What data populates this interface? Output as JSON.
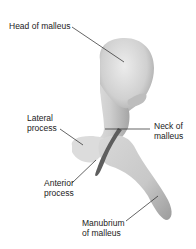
{
  "figure": {
    "labels": [
      {
        "id": "head",
        "text": "Head of malleus"
      },
      {
        "id": "lateral",
        "line1": "Lateral",
        "line2": "process"
      },
      {
        "id": "neck",
        "line1": "Neck of",
        "line2": "malleus"
      },
      {
        "id": "anterior",
        "line1": "Anterior",
        "line2": "process"
      },
      {
        "id": "manubrium",
        "line1": "Manubrium",
        "line2": "of malleus"
      }
    ],
    "colors": {
      "background": "#ffffff",
      "bone_light": "#e4e4e4",
      "bone_mid": "#c4c4c4",
      "bone_dark": "#7a7a7a",
      "leader_line": "#222222"
    }
  }
}
